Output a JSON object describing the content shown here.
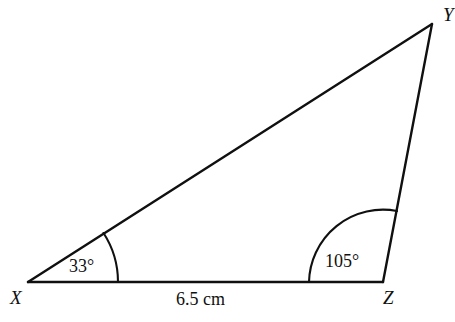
{
  "figure": {
    "type": "triangle-geometry-diagram",
    "background_color": "#ffffff",
    "stroke_color": "#101010",
    "stroke_width": 2
  },
  "vertices": {
    "x": {
      "label": "X",
      "px": [
        28,
        282
      ]
    },
    "y": {
      "label": "Y",
      "px": [
        432,
        24
      ]
    },
    "z": {
      "label": "Z",
      "px": [
        383,
        282
      ]
    }
  },
  "angles": {
    "at_x": {
      "label": "33°",
      "value": 33,
      "unit": "degrees",
      "arc_radius_px": 90
    },
    "at_z": {
      "label": "105°",
      "value": 105,
      "unit": "degrees",
      "arc_radius_px": 74
    }
  },
  "sides": {
    "xz": {
      "label": "6.5 cm",
      "value": 6.5,
      "unit": "cm"
    }
  }
}
